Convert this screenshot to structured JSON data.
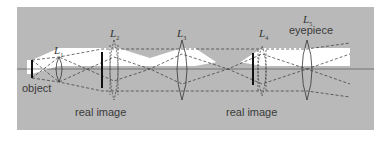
{
  "diagram": {
    "type": "optical ray diagram (compound microscope / relay lens system)",
    "colors": {
      "background": "#b9b9b9",
      "beam": "#ffffff",
      "line": "#333333",
      "frame": "#ffffff"
    },
    "lenses": [
      {
        "id": "L1",
        "letter": "L",
        "sub": "1",
        "x": 59
      },
      {
        "id": "L2",
        "letter": "L",
        "sub": "2",
        "x": 114
      },
      {
        "id": "L3",
        "letter": "L",
        "sub": "3",
        "x": 182
      },
      {
        "id": "L4",
        "letter": "L",
        "sub": "4",
        "x": 262
      },
      {
        "id": "L5",
        "letter": "L",
        "sub": "5",
        "x": 307
      }
    ],
    "labels": {
      "object": "object",
      "real_image_1": "real image",
      "real_image_2": "real image",
      "eyepiece": "eyepiece"
    }
  }
}
